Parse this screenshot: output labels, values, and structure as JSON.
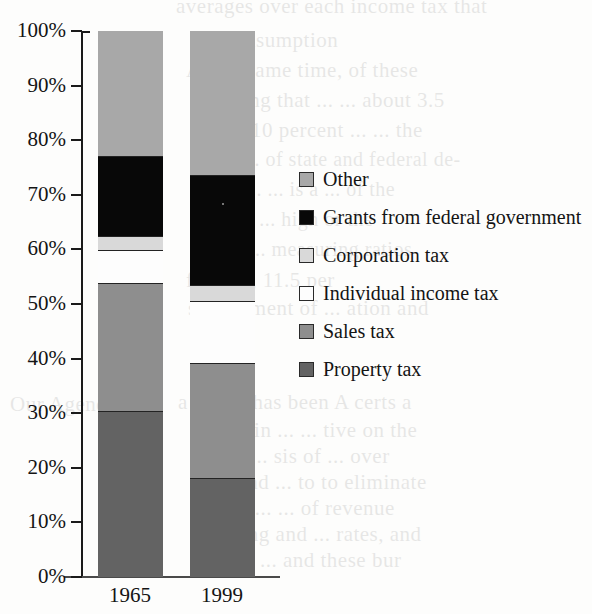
{
  "chart_data": {
    "type": "bar",
    "subtype": "stacked-percentage",
    "title": "",
    "xlabel": "",
    "ylabel": "",
    "categories": [
      "1965",
      "1999"
    ],
    "ylim": [
      0,
      100
    ],
    "yticks": [
      0,
      10,
      20,
      30,
      40,
      50,
      60,
      70,
      80,
      90,
      100
    ],
    "ytick_labels": [
      "0%",
      "10%",
      "20%",
      "30%",
      "40%",
      "50%",
      "60%",
      "70%",
      "80%",
      "90%",
      "100%"
    ],
    "grid": false,
    "legend_position": "right",
    "series": [
      {
        "name": "Property tax",
        "values": [
          30.3,
          18.0
        ],
        "color": "#636363"
      },
      {
        "name": "Sales tax",
        "values": [
          23.5,
          21.2
        ],
        "color": "#8e8e8e"
      },
      {
        "name": "Individual income tax",
        "values": [
          6.0,
          11.3
        ],
        "color": "#fdfdfd"
      },
      {
        "name": "Corporation tax",
        "values": [
          2.6,
          3.0
        ],
        "color": "#d9d9d9"
      },
      {
        "name": "Grants from federal government",
        "values": [
          14.7,
          20.0
        ],
        "color": "#080808"
      },
      {
        "name": "Other",
        "values": [
          22.9,
          26.5
        ],
        "color": "#a8a8a8"
      }
    ],
    "cumulative_tops": {
      "1965": [
        30.3,
        53.8,
        59.8,
        62.4,
        77.1,
        100.0
      ],
      "1999": [
        18.0,
        39.2,
        50.5,
        53.5,
        73.5,
        100.0
      ]
    }
  },
  "legend": {
    "items": [
      {
        "label": "Other",
        "color": "#a8a8a8"
      },
      {
        "label": "Grants from federal government",
        "color": "#080808"
      },
      {
        "label": "Corporation tax",
        "color": "#d9d9d9"
      },
      {
        "label": "Individual income tax",
        "color": "#fdfdfd"
      },
      {
        "label": "Sales tax",
        "color": "#8e8e8e"
      },
      {
        "label": "Property tax",
        "color": "#636363"
      }
    ]
  },
  "axis": {
    "y_labels": [
      "100%",
      "90%",
      "80%",
      "70%",
      "60%",
      "50%",
      "40%",
      "30%",
      "20%",
      "10%",
      "0%"
    ],
    "x_labels": [
      "1965",
      "1999"
    ]
  },
  "bleed_text": {
    "lines": [
      {
        "text": "averages over each income tax that",
        "x": 176,
        "y": -6,
        "size": 21
      },
      {
        "text": "of consumption",
        "x": 200,
        "y": 28,
        "size": 21
      },
      {
        "text": "At the same time, of these",
        "x": 186,
        "y": 58,
        "size": 21
      },
      {
        "text": "standing that ... ... about 3.5",
        "x": 196,
        "y": 88,
        "size": 21
      },
      {
        "text": "about 10 percent ... ... the",
        "x": 196,
        "y": 118,
        "size": 21
      },
      {
        "text": "the ... of state and federal de-",
        "x": 212,
        "y": 148,
        "size": 20
      },
      {
        "text": "tax ... ... is a ... of the",
        "x": 214,
        "y": 178,
        "size": 20
      },
      {
        "text": "of ... ... high or the",
        "x": 214,
        "y": 208,
        "size": 20
      },
      {
        "text": "the ... measuring ratios",
        "x": 218,
        "y": 238,
        "size": 20
      },
      {
        "text": "finance, 11.5 per",
        "x": 186,
        "y": 268,
        "size": 21
      },
      {
        "text": "sustainment of ... ation and",
        "x": 188,
        "y": 296,
        "size": 21
      },
      {
        "text": "Our Agenda",
        "x": 10,
        "y": 392,
        "size": 21
      },
      {
        "text": "a sector has been A certs  a",
        "x": 178,
        "y": 390,
        "size": 21
      },
      {
        "text": "results in ... ... tive on the",
        "x": 190,
        "y": 418,
        "size": 21
      },
      {
        "text": "on the ... sis of ... over",
        "x": 190,
        "y": 444,
        "size": 21
      },
      {
        "text": "back and ... to to eliminate",
        "x": 190,
        "y": 470,
        "size": 21
      },
      {
        "text": "tary of ... ... of revenue",
        "x": 190,
        "y": 496,
        "size": 21
      },
      {
        "text": "spending and ... rates, and",
        "x": 190,
        "y": 522,
        "size": 21
      },
      {
        "text": "nations ... and these bur",
        "x": 190,
        "y": 548,
        "size": 21
      }
    ]
  }
}
